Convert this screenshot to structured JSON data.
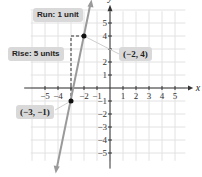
{
  "chart_data": {
    "type": "line",
    "title": "",
    "xlabel": "x",
    "ylabel": "y",
    "xlim": [
      -6,
      6
    ],
    "ylim": [
      -6,
      6
    ],
    "grid": true,
    "x_ticks": [
      -5,
      -4,
      -3,
      -2,
      -1,
      1,
      2,
      3,
      4,
      5
    ],
    "y_ticks": [
      -5,
      -4,
      -3,
      -2,
      -1,
      1,
      2,
      3,
      4,
      5
    ],
    "x_tick_labels": [
      "−5",
      "−4",
      "−2",
      "−1",
      "1",
      "2",
      "3",
      "4",
      "5"
    ],
    "y_tick_labels": [
      "5",
      "4",
      "2",
      "1",
      "−1",
      "−2",
      "−3",
      "−4",
      "−5"
    ],
    "series": [
      {
        "name": "line through (−3, −1) and (−2, 4)",
        "slope": 5,
        "points": [
          {
            "x": -3,
            "y": -1,
            "label": "(−3, −1)"
          },
          {
            "x": -2,
            "y": 4,
            "label": "(−2, 4)"
          }
        ],
        "color": "#9a9a9a"
      }
    ],
    "annotations": [
      {
        "text": "Run: 1 unit"
      },
      {
        "text": "Rise: 5 units"
      },
      {
        "text": "(−2, 4)"
      },
      {
        "text": "(−3, −1)"
      }
    ]
  },
  "labels": {
    "run": "Run: 1 unit",
    "rise": "Rise: 5 units",
    "point_upper": "(−2, 4)",
    "point_lower": "(−3, −1)",
    "x_axis": "x",
    "y_axis": "y"
  },
  "colors": {
    "grid": "#e2e2e2",
    "axis": "#333333",
    "line": "#9a9a9a",
    "point": "#111111",
    "callout_bg": "#d9d9d9"
  }
}
